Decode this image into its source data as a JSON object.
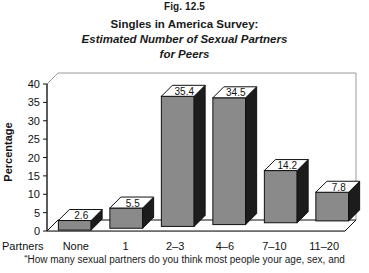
{
  "figure_label": "Fig. 12.5",
  "title": {
    "line1": "Singles in America Survey:",
    "line2": "Estimated Number of Sexual Partners",
    "line3": "for Peers"
  },
  "caption": "“How many sexual partners do you think most people your age, sex, and",
  "colors": {
    "bar_front": "#8a8a8a",
    "bar_side": "#1c1c1c",
    "bar_top": "#ffffff",
    "outline": "#111111",
    "frame": "#9a9a9a",
    "text": "#111111",
    "background": "#ffffff"
  },
  "chart_data": {
    "type": "bar",
    "title": "Singles in America Survey: Estimated Number of Sexual Partners for Peers",
    "xlabel": "Partners",
    "ylabel": "Percentage",
    "categories": [
      "None",
      "1",
      "2–3",
      "4–6",
      "7–10",
      "11–20"
    ],
    "values": [
      2.6,
      5.5,
      35.4,
      34.5,
      14.2,
      7.8
    ],
    "value_labels": [
      "2.6",
      "5.5",
      "35.4",
      "34.5",
      "14.2",
      "7.8"
    ],
    "ylim": [
      0,
      40
    ],
    "yticks": [
      0,
      5,
      10,
      15,
      20,
      25,
      30,
      35,
      40
    ],
    "ytick_labels": [
      "0",
      "5",
      "10",
      "15",
      "20",
      "25",
      "30",
      "35",
      "40"
    ],
    "grid": false,
    "legend": false,
    "style": "3d-columns"
  }
}
